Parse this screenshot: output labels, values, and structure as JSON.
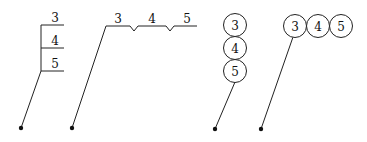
{
  "diagram": {
    "colors": {
      "stroke": "#222222",
      "background": "#ffffff"
    },
    "callouts": [
      {
        "id": "vertical-stacked-underline",
        "style": "vertical stacked underlined labels with bracket",
        "labels": [
          "3",
          "4",
          "5"
        ]
      },
      {
        "id": "horizontal-notched-underline",
        "style": "horizontal underlined labels separated by notches",
        "labels": [
          "3",
          "4",
          "5"
        ]
      },
      {
        "id": "vertical-stacked-circles",
        "style": "vertical stack of circle balloons",
        "labels": [
          "3",
          "4",
          "5"
        ]
      },
      {
        "id": "horizontal-row-circles",
        "style": "horizontal row of circle balloons",
        "labels": [
          "3",
          "4",
          "5"
        ]
      }
    ]
  }
}
